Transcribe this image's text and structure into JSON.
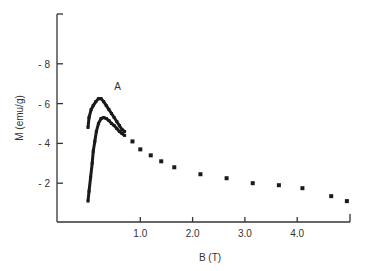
{
  "chart_data": {
    "type": "scatter",
    "title": "",
    "xlabel": "B (T)",
    "ylabel": "M (emu/g)",
    "xlim": [
      0,
      5.0
    ],
    "ylim": [
      0,
      10
    ],
    "x_ticks": [
      "1.0",
      "2.0",
      "3.0",
      "4.0"
    ],
    "y_ticks": [
      "- 2",
      "- 4",
      "- 6",
      "- 8"
    ],
    "annotations": [
      {
        "text": "A",
        "x": 0.5,
        "y": 6.7
      }
    ],
    "grid": false,
    "series": [
      {
        "name": "upper branch (A)",
        "x": [
          0.0,
          0.02,
          0.06,
          0.1,
          0.15,
          0.2,
          0.25,
          0.3,
          0.35,
          0.4,
          0.45,
          0.5,
          0.55,
          0.6,
          0.65,
          0.7
        ],
        "y": [
          4.8,
          5.3,
          5.7,
          5.9,
          6.1,
          6.25,
          6.25,
          6.1,
          5.9,
          5.7,
          5.5,
          5.3,
          5.1,
          4.9,
          4.7,
          4.6
        ]
      },
      {
        "name": "lower branch",
        "x": [
          0.0,
          0.02,
          0.05,
          0.08,
          0.1,
          0.13,
          0.16,
          0.2,
          0.25,
          0.3,
          0.35,
          0.4,
          0.45,
          0.5,
          0.55,
          0.6,
          0.65,
          0.7
        ],
        "y": [
          1.1,
          1.6,
          2.3,
          3.0,
          3.6,
          4.1,
          4.6,
          5.0,
          5.25,
          5.3,
          5.25,
          5.15,
          5.0,
          4.9,
          4.75,
          4.6,
          4.5,
          4.4
        ]
      },
      {
        "name": "high-field points",
        "x": [
          0.85,
          1.0,
          1.2,
          1.4,
          1.65,
          2.15,
          2.65,
          3.15,
          3.65,
          4.1,
          4.65,
          4.95
        ],
        "y": [
          4.1,
          3.7,
          3.4,
          3.1,
          2.8,
          2.45,
          2.25,
          2.0,
          1.9,
          1.75,
          1.35,
          1.1
        ]
      }
    ]
  }
}
